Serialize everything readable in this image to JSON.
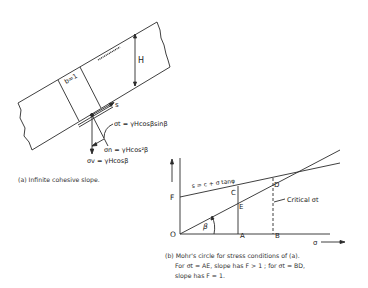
{
  "figure_a": {
    "labels": {
      "width": "b=1",
      "height": "H",
      "shear_direction": "s",
      "tangential_stress": "σt = γHcosβsinβ",
      "normal_stress": "σn = γHcos²β",
      "vertical_stress": "σv = γHcosβ"
    },
    "caption": "(a) Infinite cohesive slope."
  },
  "figure_b": {
    "labels": {
      "origin": "O",
      "point_F": "F",
      "point_A": "A",
      "point_B": "B",
      "point_C": "C",
      "point_D": "D",
      "point_E": "E",
      "angle": "β",
      "strength_line": "s = c + σ tanφ",
      "critical": "Critical σt",
      "x_axis": "σ"
    },
    "caption": {
      "line1": "(b) Mohr's circle for stress conditions of (a).",
      "line2": "For σt = AE, slope has F > 1 ;  for σt = BD,",
      "line3": "slope has F = 1."
    }
  }
}
